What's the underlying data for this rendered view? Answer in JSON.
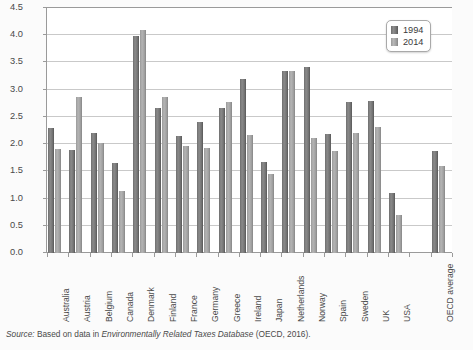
{
  "chart_data": {
    "type": "bar",
    "title": "",
    "xlabel": "",
    "ylabel": "% of GDP",
    "ylim": [
      0,
      4.5
    ],
    "ytick_step": 0.5,
    "yticks": [
      "4.5",
      "4.0",
      "3.5",
      "3.0",
      "2.5",
      "2.0",
      "1.5",
      "1.0",
      "0.5",
      "0.0"
    ],
    "grid": true,
    "legend_position": "top-right",
    "categories": [
      "Australia",
      "Austria",
      "Belgium",
      "Canada",
      "Denmark",
      "Finland",
      "France",
      "Germany",
      "Greece",
      "Ireland",
      "Japan",
      "Netherlands",
      "Norway",
      "Spain",
      "Sweden",
      "UK",
      "USA",
      "",
      "OECD average"
    ],
    "series": [
      {
        "name": "1994",
        "color": "#6e6e6e",
        "values": [
          2.29,
          1.9,
          2.21,
          1.66,
          3.99,
          2.67,
          2.15,
          2.41,
          2.67,
          3.19,
          1.68,
          3.35,
          3.42,
          2.18,
          2.78,
          2.79,
          1.1,
          null,
          1.87
        ]
      },
      {
        "name": "2014",
        "color": "#a8a8a8",
        "values": [
          1.91,
          2.87,
          2.02,
          1.14,
          4.1,
          2.87,
          1.96,
          1.93,
          2.77,
          2.16,
          1.46,
          3.35,
          2.11,
          1.88,
          2.2,
          2.31,
          0.7,
          null,
          1.59
        ]
      }
    ]
  },
  "legend": {
    "items": [
      {
        "label": "1994"
      },
      {
        "label": "2014"
      }
    ]
  },
  "source": {
    "prefix": "Source:",
    "middle": " Based on data in ",
    "italic_title": "Environmentally Related Taxes Database",
    "suffix": " (OECD, 2016)."
  }
}
